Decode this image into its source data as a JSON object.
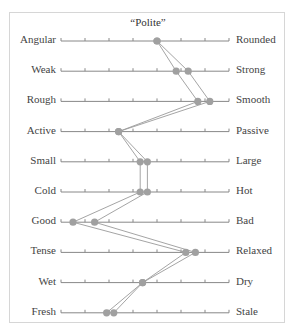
{
  "chart_data": {
    "type": "line",
    "title": "“Polite”",
    "subtype": "semantic-differential profile",
    "scale": {
      "min": 0,
      "max": 7,
      "ticks": 8,
      "x_start": 61,
      "x_step": 24
    },
    "categories": [
      {
        "left": "Angular",
        "right": "Rounded"
      },
      {
        "left": "Weak",
        "right": "Strong"
      },
      {
        "left": "Rough",
        "right": "Smooth"
      },
      {
        "left": "Active",
        "right": "Passive"
      },
      {
        "left": "Small",
        "right": "Large"
      },
      {
        "left": "Cold",
        "right": "Hot"
      },
      {
        "left": "Good",
        "right": "Bad"
      },
      {
        "left": "Tense",
        "right": "Relaxed"
      },
      {
        "left": "Wet",
        "right": "Dry"
      },
      {
        "left": "Fresh",
        "right": "Stale"
      }
    ],
    "series": [
      {
        "name": "Profile A",
        "values": [
          4.0,
          4.8,
          5.7,
          2.4,
          3.3,
          3.3,
          0.5,
          5.2,
          3.4,
          1.9
        ]
      },
      {
        "name": "Profile B",
        "values": [
          4.0,
          5.3,
          6.2,
          2.4,
          3.6,
          3.6,
          1.4,
          5.6,
          3.4,
          2.2
        ]
      }
    ],
    "grid": false,
    "legend": "none",
    "colors": {
      "axis": "#888888",
      "line": "#9a9a9a",
      "marker": "#a0a0a0",
      "frame": "#d6d6d6"
    }
  }
}
